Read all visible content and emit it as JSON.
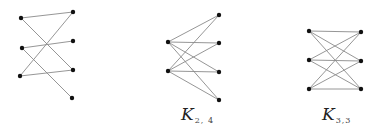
{
  "figure": {
    "graphs": [
      {
        "id": "graph-1",
        "label_main": "",
        "label_sub": "",
        "vertices": [
          [
            21,
            18
          ],
          [
            22,
            48
          ],
          [
            20,
            76
          ],
          [
            73,
            12
          ],
          [
            73,
            41
          ],
          [
            73,
            70
          ],
          [
            72,
            98
          ]
        ],
        "edges": [
          [
            0,
            3
          ],
          [
            0,
            5
          ],
          [
            1,
            4
          ],
          [
            1,
            6
          ],
          [
            2,
            3
          ],
          [
            2,
            5
          ]
        ]
      },
      {
        "id": "graph-k24",
        "label_main": "K",
        "label_sub": "2, 4",
        "label_pos": [
          181,
          106
        ],
        "vertices": [
          [
            168,
            42
          ],
          [
            168,
            71
          ],
          [
            219,
            15
          ],
          [
            219,
            43
          ],
          [
            219,
            72
          ],
          [
            219,
            100
          ]
        ],
        "edges": [
          [
            0,
            2
          ],
          [
            0,
            3
          ],
          [
            0,
            4
          ],
          [
            0,
            5
          ],
          [
            1,
            2
          ],
          [
            1,
            3
          ],
          [
            1,
            4
          ],
          [
            1,
            5
          ]
        ]
      },
      {
        "id": "graph-k33",
        "label_main": "K",
        "label_sub": "3,3",
        "label_pos": [
          322,
          106
        ],
        "vertices": [
          [
            309,
            31
          ],
          [
            309,
            60
          ],
          [
            309,
            89
          ],
          [
            361,
            32
          ],
          [
            361,
            61
          ],
          [
            361,
            89
          ]
        ],
        "edges": [
          [
            0,
            3
          ],
          [
            0,
            4
          ],
          [
            0,
            5
          ],
          [
            1,
            3
          ],
          [
            1,
            4
          ],
          [
            1,
            5
          ],
          [
            2,
            3
          ],
          [
            2,
            4
          ],
          [
            2,
            5
          ]
        ]
      }
    ],
    "colors": {
      "edge": "#8a8a8a",
      "vertex": "#111111",
      "background": "#ffffff"
    }
  }
}
